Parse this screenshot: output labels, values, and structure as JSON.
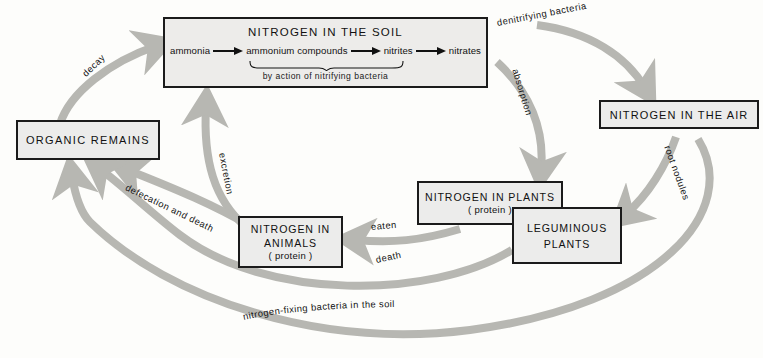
{
  "diagram": {
    "accent_arrow_color": "#b7b7b2",
    "box_fill": "#ececeb",
    "box_border": "#1b1b1b"
  },
  "boxes": {
    "soil": {
      "title": "NITROGEN IN THE SOIL",
      "chain": [
        "ammonia",
        "ammonium compounds",
        "nitrites",
        "nitrates"
      ],
      "note": "by action of nitrifying bacteria"
    },
    "organic_remains": {
      "title": "ORGANIC REMAINS"
    },
    "air": {
      "title": "NITROGEN IN THE AIR"
    },
    "plants": {
      "title": "NITROGEN IN PLANTS",
      "sub": "( protein )"
    },
    "leguminous": {
      "line1": "LEGUMINOUS",
      "line2": "PLANTS"
    },
    "animals": {
      "line1": "NITROGEN IN",
      "line2": "ANIMALS",
      "sub": "( protein )"
    }
  },
  "labels": {
    "decay": "decay",
    "denitrifying": "denitrifying bacteria",
    "absorption": "absorption",
    "excretion": "excretion",
    "defecation": "defecation and death",
    "eaten": "eaten",
    "death": "death",
    "root_nodules": "root nodules",
    "nitrogen_fixing": "nitrogen-fixing bacteria in the soil"
  }
}
